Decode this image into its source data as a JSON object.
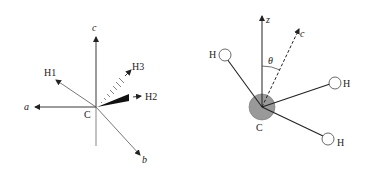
{
  "left_diagram": {
    "center_label": "C",
    "axes": {
      "a": "a",
      "b": "b",
      "c": "c"
    },
    "hydrogens": {
      "h1": "H1",
      "h2": "H2",
      "h3": "H3"
    }
  },
  "right_diagram": {
    "center_label": "C",
    "axes": {
      "z": "z",
      "c": "c"
    },
    "angle_label": "θ",
    "hydrogens": [
      "H",
      "H",
      "H"
    ]
  },
  "colors": {
    "line": "#222222",
    "carbon_fill": "#999999",
    "hydrogen_fill": "#ffffff"
  }
}
